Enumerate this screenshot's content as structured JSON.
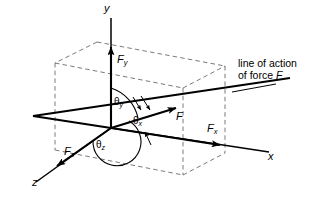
{
  "figure": {
    "title_text": "",
    "colors": {
      "stroke": "#000000",
      "dashed": "#6b6b6b",
      "background": "#ffffff"
    }
  },
  "axes": {
    "x_label": "x",
    "y_label": "y",
    "z_label": "z"
  },
  "vectors": {
    "force_label": "F",
    "fx_label": "F",
    "fx_sub": "x",
    "fy_label": "F",
    "fy_sub": "y",
    "fz_label": "F",
    "fz_sub": "z"
  },
  "angles": {
    "theta_x": "θ",
    "theta_x_sub": "x",
    "theta_y": "θ",
    "theta_y_sub": "y",
    "theta_z": "θ",
    "theta_z_sub": "z"
  },
  "callout": {
    "line1": "line of action",
    "line2_prefix": "of force ",
    "line2_symbol": "F"
  }
}
